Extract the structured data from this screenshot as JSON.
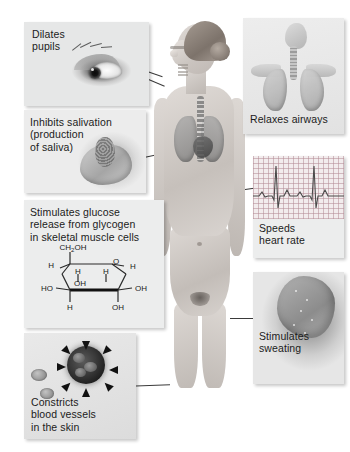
{
  "callouts": [
    {
      "id": "eye",
      "label": "Dilates\npupils",
      "text_lines": [
        "Dilates",
        "pupils"
      ],
      "art": "close-up of a human eye with widely dilated pupil",
      "side": "left",
      "target": "eye"
    },
    {
      "id": "salivation",
      "label": "Inhibits salivation\n(production\nof saliva)",
      "text_lines": [
        "Inhibits salivation",
        "(production",
        "of saliva)"
      ],
      "art": "lower jaw in profile with salivary gland highlighted",
      "side": "left",
      "target": "mouth"
    },
    {
      "id": "glucose",
      "label": "Stimulates glucose\nrelease from glycogen\nin skeletal muscle cells",
      "text_lines": [
        "Stimulates glucose",
        "release from glycogen",
        "in skeletal muscle cells"
      ],
      "art": "glucose ring structural formula",
      "side": "left",
      "target": "skeletal-muscle"
    },
    {
      "id": "vasoconstriction",
      "label": "Constricts\nblood vessels\nin the skin",
      "text_lines": [
        "Constricts",
        "blood vessels",
        "in the skin"
      ],
      "art": "cross-section of blood vessel squeezed by inward arrows",
      "side": "left",
      "target": "hand-skin"
    },
    {
      "id": "airways",
      "label": "Relaxes airways",
      "text_lines": [
        "Relaxes airways"
      ],
      "art": "head, trachea and lungs of the respiratory tract",
      "side": "right",
      "target": "lungs"
    },
    {
      "id": "heart",
      "label": "Speeds\nheart rate",
      "text_lines": [
        "Speeds",
        "heart rate"
      ],
      "art": "electrocardiogram trace on graph paper",
      "side": "right",
      "target": "heart"
    },
    {
      "id": "sweating",
      "label": "Stimulates\nsweating",
      "text_lines": [
        "Stimulates",
        "sweating"
      ],
      "art": "close-up of moist skin surface",
      "side": "right",
      "target": "skin"
    }
  ],
  "glucose_formula": {
    "name": "glucose",
    "top_group": "CH2OH",
    "top_group_main": "CH",
    "top_group_sub": "2",
    "top_group_tail": "OH",
    "ring_oxygen": "O",
    "labels": {
      "h_upper_left": "H",
      "h_upper_right": "H",
      "h_inner_left": "H",
      "h_inner_right": "H",
      "oh_inner_left": "OH",
      "ho_left": "HO",
      "oh_right": "OH",
      "h_bottom": "H",
      "oh_bottom": "OH"
    }
  },
  "ecg": {
    "paper": "pink grid graph paper",
    "beats": 2,
    "trace_color": "#4a4a4a"
  },
  "colors": {
    "background": "#ffffff",
    "panel": "#eceded",
    "text": "#1b1b1b",
    "leader_line": "#3a3a3a",
    "ecg_paper": "#f2eced",
    "ecg_grid": "#b48c96"
  }
}
